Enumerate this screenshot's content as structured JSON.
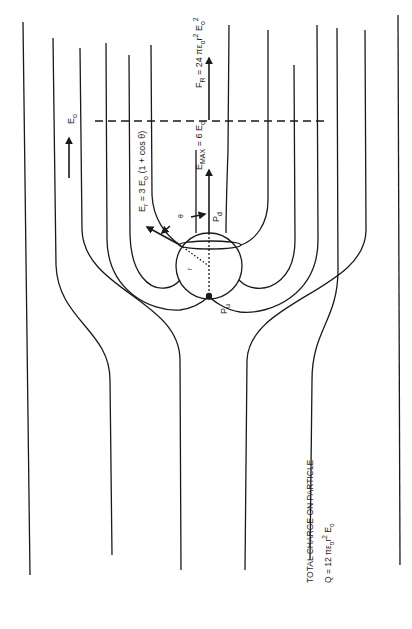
{
  "figure": {
    "type": "electric field lines around a conducting sphere in uniform field (rotated 90°)",
    "labels": {
      "applied_field": "E",
      "applied_field_sub": "o",
      "radial_field": "E",
      "radial_field_sub": "r",
      "radial_field_expr": " = 3 E",
      "radial_field_expr_sub": "o",
      "radial_field_expr_tail": " (1 + cos θ)",
      "max_field": "E",
      "max_field_sub": "MAX",
      "max_field_expr": " = 6 E",
      "max_field_expr_sub": "o",
      "force": "F",
      "force_sub": "R",
      "force_expr": " = 24 πε",
      "force_expr_sub": "o",
      "force_expr_tail": "r",
      "force_expr_sup": "2",
      "force_expr_e": " E",
      "force_expr_e_sub": "o",
      "force_expr_e_sup": "2",
      "theta": "θ",
      "radius": "r",
      "point_downstream": "P",
      "point_downstream_sub": "d",
      "point_upstream": "P",
      "point_upstream_sub": "u",
      "charge_title": "TOTAL CHARGE ON PARTICLE",
      "charge_expr": "Q = 12 πε",
      "charge_expr_sub": "o",
      "charge_expr_r": "r",
      "charge_expr_sup": "2",
      "charge_expr_e": " E",
      "charge_expr_e_sub": "o"
    },
    "colors": {
      "ink": "#1a1a1a",
      "background": "#ffffff"
    }
  }
}
